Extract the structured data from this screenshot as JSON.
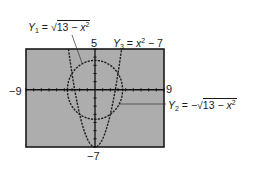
{
  "window": {
    "xmin_label": "−9",
    "xmax_label": "9",
    "ymax_label": "5",
    "ymin_label": "−7"
  },
  "equations": {
    "y1": {
      "name": "Y",
      "sub": "1",
      "eq": " = ",
      "root_prefix": "√",
      "radicand_a": "13 − ",
      "var": "x",
      "exp": "2"
    },
    "y2": {
      "name": "Y",
      "sub": "2",
      "eq": " = −",
      "root_prefix": "√",
      "radicand_a": "13 − ",
      "var": "x",
      "exp": "2"
    },
    "y3": {
      "name": "Y",
      "sub": "3",
      "eq": " = ",
      "var": "x",
      "exp": "2",
      "tail": " − 7"
    }
  },
  "colors": {
    "screen_bg": "#adadad",
    "curve": "#1f1f1f",
    "axis": "#111111",
    "frame": "#1a1a1a"
  },
  "chart_data": {
    "type": "line",
    "title": "",
    "xlabel": "",
    "ylabel": "",
    "xlim": [
      -9,
      9
    ],
    "ylim": [
      -7,
      5
    ],
    "xscl": 1,
    "yscl": 1,
    "grid": false,
    "tick_labels": {
      "x": [
        "−9",
        "9"
      ],
      "y": [
        "−7",
        "5"
      ]
    },
    "series": [
      {
        "name": "Y1 = √(13 − x²)",
        "expression": "sqrt(13 - x^2)",
        "domain": [
          -3.606,
          3.606
        ],
        "x": [
          -3.606,
          -3,
          -2,
          -1,
          0,
          1,
          2,
          3,
          3.606
        ],
        "values": [
          0,
          2,
          3,
          3.46,
          3.61,
          3.46,
          3,
          2,
          0
        ]
      },
      {
        "name": "Y2 = −√(13 − x²)",
        "expression": "-sqrt(13 - x^2)",
        "domain": [
          -3.606,
          3.606
        ],
        "x": [
          -3.606,
          -3,
          -2,
          -1,
          0,
          1,
          2,
          3,
          3.606
        ],
        "values": [
          0,
          -2,
          -3,
          -3.46,
          -3.61,
          -3.46,
          -3,
          -2,
          0
        ]
      },
      {
        "name": "Y3 = x² − 7",
        "expression": "x^2 - 7",
        "domain": [
          -3.464,
          3.464
        ],
        "x": [
          -3.464,
          -3,
          -2,
          -1,
          0,
          1,
          2,
          3,
          3.464
        ],
        "values": [
          5,
          2,
          -3,
          -6,
          -7,
          -6,
          -3,
          2,
          5
        ]
      }
    ],
    "annotations": [
      {
        "text": "Y1 = √(13 − x²)",
        "points_to": "upper semicircle"
      },
      {
        "text": "Y3 = x² − 7",
        "points_to": "parabola"
      },
      {
        "text": "Y2 = −√(13 − x²)",
        "points_to": "lower semicircle"
      }
    ]
  }
}
